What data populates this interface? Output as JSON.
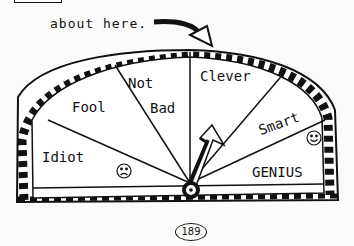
{
  "caption": "about here.",
  "meter": {
    "labels": {
      "idiot": "Idiot",
      "fool": "Fool",
      "not": "Not",
      "bad": "Bad",
      "clever": "Clever",
      "smart": "Smart",
      "genius": "GENIUS"
    },
    "icons": [
      "sad-face-icon",
      "smiley-face-icon",
      "pointer-arrow-icon",
      "curved-arrow-icon"
    ]
  },
  "page_number": "189"
}
